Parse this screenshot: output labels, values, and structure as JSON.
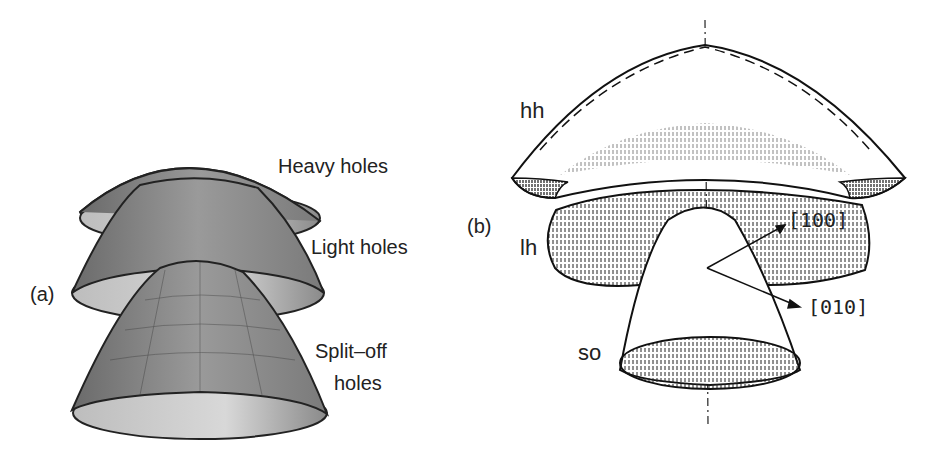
{
  "panel_a": {
    "label": "(a)",
    "surfaces": [
      {
        "name": "Heavy holes"
      },
      {
        "name": "Light holes"
      },
      {
        "name": "Split-off holes",
        "line1": "Split–off",
        "line2": "holes"
      }
    ]
  },
  "panel_b": {
    "label": "(b)",
    "surfaces": [
      {
        "name": "hh"
      },
      {
        "name": "lh"
      },
      {
        "name": "so"
      }
    ],
    "axes": [
      {
        "name": "[100]"
      },
      {
        "name": "[010]"
      }
    ]
  }
}
